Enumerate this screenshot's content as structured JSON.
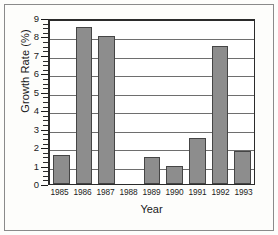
{
  "chart_data": {
    "type": "bar",
    "title": "",
    "xlabel": "Year",
    "ylabel": "Growth Rate (%)",
    "categories": [
      "1985",
      "1986",
      "1987",
      "1988",
      "1989",
      "1990",
      "1991",
      "1992",
      "1993"
    ],
    "values": [
      1.6,
      8.5,
      8.0,
      0,
      1.45,
      1.0,
      2.5,
      7.5,
      1.8
    ],
    "ylim": [
      0,
      9
    ],
    "ytick_labels": [
      "0",
      "1",
      "2",
      "3",
      "4",
      "5",
      "6",
      "7",
      "8",
      "9"
    ],
    "ytick_values": [
      0,
      1,
      2,
      3,
      4,
      5,
      6,
      7,
      8,
      9
    ],
    "y_minor_tick_interval": 0.25,
    "grid": "horizontal",
    "legend": "none",
    "bar_fill": "gray-crosshatch-pattern",
    "bar_edge_color": "#454545",
    "grid_color": "#6e6e6e",
    "axis_color": "#2b2b2b",
    "background_color": "#ffffff",
    "frame_color": "#8a8a8a"
  }
}
